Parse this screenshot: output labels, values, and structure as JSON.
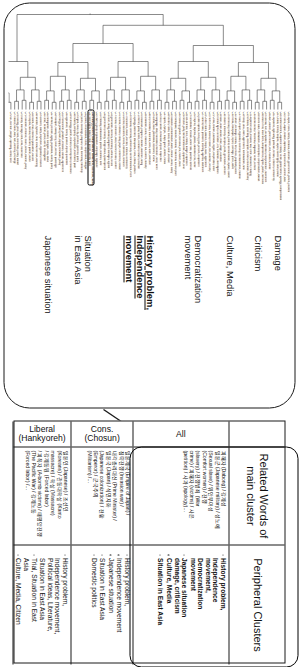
{
  "figure": {
    "orientation": "rotated-90-ccw",
    "dendrogram_panel": {
      "cluster_labels": [
        {
          "id": "damage",
          "text": "Damage",
          "emphasis": false
        },
        {
          "id": "criticism",
          "text": "Criticism",
          "emphasis": false
        },
        {
          "id": "culture-media",
          "text": "Culture, Media",
          "emphasis": false
        },
        {
          "id": "democratization-movement",
          "text": "Democratization\nmovement",
          "emphasis": false
        },
        {
          "id": "history-problem-independence-movement",
          "text": "History problem,\nIndependence\nmovement",
          "emphasis": true
        },
        {
          "id": "situation-in-east-asia",
          "text": "Situation\nin East Asia",
          "emphasis": false
        },
        {
          "id": "japanese-situation",
          "text": "Japanese situation",
          "emphasis": false
        }
      ],
      "highlighted_leaf": "C53 (main cluster)",
      "leaf_labels": [
        "C01 Japan, Korea, history, textbook, distortion, government, protest, problem",
        "C02 Korea, Japan, relation, diplomacy, improvement, summit, talks",
        "C03 comfort women, Japanese military, victim, grandmother, apology, compensation",
        "C04 Dokdo, territory, dispute, Japan, sovereignty, claim, island",
        "C05 Japanese, right-wing, politician, remark, criticism, controversy",
        "C06 Abe, cabinet, prime minister, visit, Yasukuni, shrine",
        "C07 colonial, rule, occupation, liberation, independence, movement",
        "C08 March First, movement, independence, fighter, patriot, memorial",
        "C09 forced labor, mobilization, conscription, compensation, lawsuit",
        "C10 atomic bomb, Hiroshima, Nagasaki, victim, survivor",
        "C11 Japanese army, invasion, war, crime, massacre, Nanjing",
        "C12 textbook, screening, description, revision, education, ministry",
        "C13 treaty, 1965, claim, agreement, normalization, fund",
        "C14 trade, export, regulation, economy, semiconductor, material",
        "C15 culture, exchange, drama, film, music, popularity, wave",
        "C16 media, newspaper, report, coverage, press, article",
        "C17 democracy, citizen, protest, demonstration, square, candle",
        "C18 student, university, campus, youth, generation, activism",
        "C19 labor, union, worker, strike, wage, condition",
        "C20 human rights, committee, UN, resolution, investigation",
        "C21 China, relation, East Asia, region, cooperation, order",
        "C22 North Korea, nuclear, missile, test, sanction, security",
        "C23 United States, alliance, troops, base, agreement",
        "C24 summit, talks, president, meeting, agenda, statement",
        "C25 public opinion, survey, poll, percent, respondent",
        "C26 emperor, imperial, palace, abdication, era, name",
        "C27 constitution, revision, article nine, pacifism, defense",
        "C28 self-defense, force, military, budget, expansion",
        "C29 election, party, liberal democratic, opposition, seat",
        "C30 economy, growth, recession, yen, market, stock",
        "C31 earthquake, disaster, tsunami, Fukushima, nuclear plant",
        "C32 radiation, contamination, water, release, ocean, safety",
        "C33 tourism, visitor, travel, airline, route, increase",
        "C34 sports, Olympic, Tokyo, game, athlete, medal",
        "C35 food, cuisine, restaurant, import, inspection",
        "C36 language, study, translation, literature, novel, writer",
        "C37 author, book, publication, bestseller, review",
        "C38 art, exhibition, museum, work, artist, collection",
        "C39 animation, comic, character, fan, content, industry",
        "C40 broadcast, program, channel, audience, rating",
        "C41 internet, portal, online, comment, netizen, reaction",
        "C42 apology, statement, Murayama, Kono, official, position",
        "C43 memorial, ceremony, anniversary, commemoration, event",
        "C44 monument, statue, erection, removal, controversy",
        "C45 archive, document, record, disclosure, research",
        "C46 scholar, historian, study, paper, conference, debate",
        "C47 school, curriculum, class, teacher, lesson, content",
        "C48 generation, memory, testimony, witness, record",
        "C49 court, ruling, lawsuit, judgment, damages, appeal",
        "C50 government, ministry, foreign affairs, spokesperson",
        "C51 embassy, ambassador, protest, summon, note",
        "C52 citizen, group, organization, campaign, signature",
        "C53 history problem, independence movement, liberation, nation",
        "C54 sovereignty, nation, state, people, identity, pride",
        "C55 peace, reconciliation, future, cooperation, dialogue",
        "C56 youth, exchange, program, visit, homestay, friendship",
        "C57 region, local, city, province, governor, policy",
        "C58 industry, company, corporation, investment, plant",
        "C59 technology, patent, research, development, innovation",
        "C60 agriculture, fishery, product, import, quarantine",
        "C61 environment, pollution, emission, climate, agreement",
        "C62 energy, power, plant, supply, renewable, policy",
        "C63 transport, railway, ferry, route, service, passenger",
        "C64 welfare, pension, aging, population, society, policy",
        "C65 immigration, resident, foreigner, visa, status",
        "C66 crime, incident, police, arrest, investigation",
        "C67 accident, safety, inspection, regulation, measure",
        "C68 weather, typhoon, heat, snow, forecast, warning",
        "C69 health, virus, infection, quarantine, vaccine",
        "C70 hospital, medical, treatment, patient, doctor",
        "C71 education, entrance, exam, school, student, policy",
        "C72 family, marriage, birth, child, household",
        "C73 housing, price, land, real estate, policy, market",
        "C74 finance, bank, loan, rate, currency, exchange",
        "C75 tax, revenue, budget, spending, deficit, debt"
      ]
    },
    "table": {
      "headers": {
        "row_label": "",
        "related_words": "Related Words of\nmain cluster",
        "peripheral": "Peripheral Clusters"
      },
      "rows": [
        {
          "id": "all",
          "label": "All",
          "highlighted": true,
          "related_words": [
            "일본군 (Japanese military) / 성노예",
            "(Sexual slave) / 위안부여성",
            "(Comfort women) / 전쟁",
            "(slavery) / 전쟁범죄 (War",
            "crime) / 피해자 (victims) / 사은",
            "(petition) / 사과 (apology)…"
          ],
          "related_words_header": "피해자 (Dabong) / 강제성",
          "peripheral": [
            "History problem,\nIndependence\nmovement,\nDemocratization\nmovement",
            "Japanese situation\ndamage, criticism",
            "Culture, Media",
            "Situation in East Asia"
          ]
        },
        {
          "id": "cons",
          "label": "Cons.\n(Chosun)",
          "highlighted": false,
          "related_words": [
            "일본제국 (Empire of Japan) /",
            "침략전쟁 (Invasion war) /",
            "내각총리대신 (Prime Minister) /",
            "일본국 (Japan) / 식민지화",
            "(Japanese colonization) / 천황",
            "(Emperor) / 군국주의",
            "(Militarism) /…"
          ],
          "peripheral": [
            "History problem,",
            "Independence movement",
            "Japanese situation",
            "Situation in East Asia",
            "Domestic politics"
          ]
        },
        {
          "id": "liberal",
          "label": "Liberal\n(Hankyoreh)",
          "highlighted": false,
          "related_words": [
            "일본인 (Japanese) / 조선인",
            "(Koreans) / 관동대학살 (Kanto",
            "massacre) / 학살 (Massacre)",
            "/ 강제동원 (Forced labor)",
            "/ 피폭자 (A-bomb victims) / 태평양전쟁",
            "(The Pacific War) / 강제노동",
            "(Forced labor) /…"
          ],
          "peripheral": [
            "History problem,\nIndependence movement,\nPolitical ideas, Literature,\nSituation in East Asia",
            "Trial, Situation in East\nAsia",
            "Culture, Media, Citizen\nmovement"
          ]
        }
      ]
    }
  }
}
